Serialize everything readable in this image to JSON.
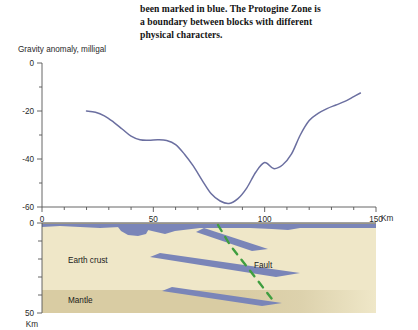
{
  "caption": {
    "lines": [
      "been marked in blue. The Protogine Zone is",
      "a boundary between blocks with different",
      "physical characters."
    ]
  },
  "chart_data": {
    "type": "line",
    "title": "Gravity anomaly, milligal",
    "xlabel": "Km",
    "ylabel": "Gravity anomaly, milligal",
    "xlim": [
      0,
      150
    ],
    "ylim": [
      -60,
      0
    ],
    "grid": false,
    "legend": "none",
    "x_ticks_major": [
      0,
      50,
      100,
      150
    ],
    "x_ticks_major_labels": [
      "0",
      "50",
      "100",
      "150"
    ],
    "x_tick_minor_step": 10,
    "y_ticks_major": [
      0,
      -20,
      -40,
      -60
    ],
    "y_ticks_major_labels": [
      "0",
      "-20",
      "-40",
      "-60"
    ],
    "y_tick_minor_step": 10,
    "x_axis_unit_label": "Km",
    "series": [
      {
        "name": "Gravity anomaly",
        "color": "#6b6fa0",
        "x": [
          20,
          24,
          28,
          32,
          36,
          40,
          44,
          48,
          52,
          56,
          60,
          64,
          68,
          72,
          76,
          80,
          84,
          88,
          92,
          96,
          100,
          104,
          108,
          112,
          116,
          120,
          124,
          128,
          132,
          136,
          140,
          143
        ],
        "values": [
          -20,
          -20.5,
          -22,
          -24.5,
          -27.5,
          -30.5,
          -32,
          -32.2,
          -32,
          -32.3,
          -34,
          -38,
          -43,
          -49,
          -54.5,
          -57.5,
          -58.5,
          -56.5,
          -52,
          -45.5,
          -41.5,
          -44,
          -42.5,
          -38,
          -30,
          -24,
          -21,
          -19,
          -17.5,
          -16,
          -14,
          -12.5
        ]
      }
    ]
  },
  "cross_section": {
    "title_unit": "Km",
    "depth_ticks_major": [
      0,
      50
    ],
    "depth_ticks_major_labels": [
      "0",
      "50"
    ],
    "depth_tick_minor_step": 10,
    "depth_unit_label": "Km",
    "layers": [
      {
        "name": "Earth crust",
        "label": "Earth crust",
        "color": "#efe7c8"
      },
      {
        "name": "Mantle",
        "label": "Mantle",
        "color": "#d9cca3"
      }
    ],
    "annotations": [
      {
        "name": "fault",
        "label": "Fault",
        "color": "#3f9e3f",
        "style": "dashed"
      }
    ],
    "blue_body": {
      "name": "protogine-zone-body",
      "color": "#7a85b8"
    }
  }
}
